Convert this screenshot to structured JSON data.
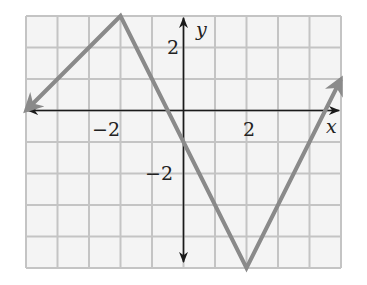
{
  "chart_data": {
    "type": "line",
    "title": "",
    "xlabel": "x",
    "ylabel": "y",
    "xlim": [
      -5,
      5
    ],
    "ylim": [
      -5,
      3
    ],
    "grid": true,
    "x_ticks_labeled": [
      "-2",
      "2"
    ],
    "y_ticks_labeled": [
      "2",
      "-2"
    ],
    "series": [
      {
        "name": "graph",
        "points": [
          [
            -5,
            0
          ],
          [
            -2,
            3
          ],
          [
            2,
            -5
          ],
          [
            5,
            1
          ]
        ],
        "arrows_at_ends": true,
        "color": "#8a8a8a"
      }
    ]
  },
  "labels": {
    "x_axis": "x",
    "y_axis": "y",
    "x_neg2": "−2",
    "x_pos2": "2",
    "y_pos2": "2",
    "y_neg2": "−2"
  },
  "colors": {
    "grid": "#c4c4c4",
    "grid_bg": "#f4f4f4",
    "axis": "#1a1a1a",
    "curve": "#8a8a8a"
  }
}
